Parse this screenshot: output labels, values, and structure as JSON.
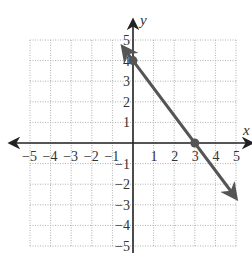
{
  "chart_data": {
    "type": "line",
    "title": "",
    "xlabel": "x",
    "ylabel": "y",
    "xlim": [
      -5,
      5
    ],
    "ylim": [
      -5,
      5
    ],
    "grid": true,
    "grid_style": "dotted",
    "x_ticks": [
      "−5",
      "−4",
      "−3",
      "−2",
      "−1",
      "1",
      "2",
      "3",
      "4",
      "5"
    ],
    "y_ticks": [
      "5",
      "4",
      "3",
      "2",
      "1",
      "−1",
      "−2",
      "−3",
      "−4",
      "−5"
    ],
    "series": [
      {
        "name": "line",
        "equation": "y = -4/3 x + 4",
        "x": [
          -0.5,
          5
        ],
        "y": [
          4.67,
          -2.67
        ],
        "color": "#555555",
        "arrows": "both"
      }
    ],
    "points": [
      {
        "label": "y-intercept",
        "x": 0,
        "y": 4
      },
      {
        "label": "x-intercept",
        "x": 3,
        "y": 0
      }
    ]
  },
  "labels": {
    "x_axis": "x",
    "y_axis": "y"
  },
  "colors": {
    "axis": "#222222",
    "grid": "#b0b0b0",
    "line": "#555555",
    "point": "#555555"
  }
}
